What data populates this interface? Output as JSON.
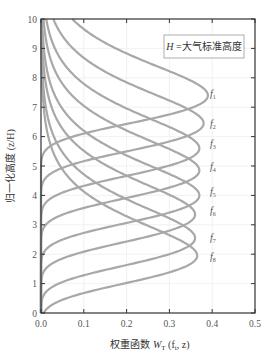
{
  "chart_data": {
    "type": "line",
    "title": "",
    "xlabel": "权重函数 W_T(f_i, z)",
    "ylabel": "归一化高度 (z/H)",
    "xlim": [
      0,
      0.5
    ],
    "ylim": [
      0,
      10
    ],
    "xticks": [
      "0.0",
      "0.1",
      "0.2",
      "0.3",
      "0.4",
      "0.5"
    ],
    "yticks": [
      "0",
      "1",
      "2",
      "3",
      "4",
      "5",
      "6",
      "7",
      "8",
      "9",
      "10"
    ],
    "grid": true,
    "legend_position": "upper right",
    "annotation": "H=大气标准高度",
    "curve_shape": "Chapman-like weighting function W = A·e^{-(z-z0)}·exp(-e^{-(z-z0)})",
    "series": [
      {
        "name": "f1",
        "peak_z": 7.4,
        "peak_w": 0.39
      },
      {
        "name": "f2",
        "peak_z": 6.45,
        "peak_w": 0.38
      },
      {
        "name": "f3",
        "peak_z": 5.6,
        "peak_w": 0.37
      },
      {
        "name": "f4",
        "peak_z": 4.85,
        "peak_w": 0.37
      },
      {
        "name": "f5",
        "peak_z": 4.0,
        "peak_w": 0.37
      },
      {
        "name": "f6",
        "peak_z": 3.35,
        "peak_w": 0.36
      },
      {
        "name": "f7",
        "peak_z": 2.55,
        "peak_w": 0.36
      },
      {
        "name": "f8",
        "peak_z": 1.95,
        "peak_w": 0.365
      }
    ],
    "colors": {
      "curve": "#a8a8a8",
      "axis": "#333333",
      "grid": "#eeeeee"
    }
  },
  "labels": {
    "xlabel_main": "权重函数 ",
    "xlabel_w": "W",
    "xlabel_sub": "T",
    "xlabel_args": " (f",
    "xlabel_args_sub": "i",
    "xlabel_args_end": ", z)",
    "ylabel": "归一化高度 (z/H)",
    "legend": "H =大气标准高度",
    "curve_labels": [
      {
        "f": "f",
        "sub": "1"
      },
      {
        "f": "f",
        "sub": "2"
      },
      {
        "f": "f",
        "sub": "3"
      },
      {
        "f": "f",
        "sub": "4"
      },
      {
        "f": "f",
        "sub": "5"
      },
      {
        "f": "f",
        "sub": "6"
      },
      {
        "f": "f",
        "sub": "7"
      },
      {
        "f": "f",
        "sub": "8"
      }
    ]
  }
}
